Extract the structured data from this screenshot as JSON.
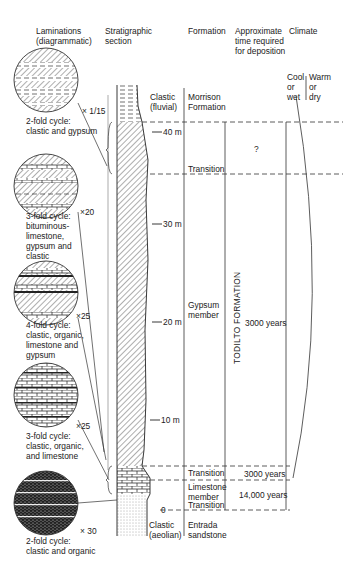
{
  "headers": {
    "laminations": "Laminations\n(diagrammatic)",
    "section": "Stratigraphic\nsection",
    "formation": "Formation",
    "time": "Approximate\ntime required\nfor deposition",
    "climate": "Climate"
  },
  "climate": {
    "cool": "Cool\nor\nwet",
    "warm": "Warm\nor\ndry"
  },
  "laminations": [
    {
      "scale": "× 1/15",
      "caption": "2-fold cycle:\nclastic and gypsum"
    },
    {
      "scale": "×20",
      "caption": "3-fold cycle:\nbituminous-\nlimestone,\ngypsum and\nclastic"
    },
    {
      "scale": "×25",
      "caption": "4-fold cycle:\nclastic, organic,\nlimestone and\ngypsum"
    },
    {
      "scale": "×25",
      "caption": "3-fold cycle:\nclastic, organic,\nand limestone"
    },
    {
      "scale": "× 30",
      "caption": "2-fold cycle:\nclastic and organic"
    }
  ],
  "depth_ticks": [
    "40 m",
    "30 m",
    "20 m",
    "10 m",
    "0"
  ],
  "lithology_labels": {
    "top": "Clastic\n(fluvial)",
    "bottom": "Clastic\n(aeolian)"
  },
  "formations": {
    "morrison": "Morrison\nFormation",
    "transition_upper": "Transition",
    "gypsum": "Gypsum\nmember",
    "transition_mid": "Transition",
    "limestone": "Limestone\nmember",
    "transition_lower": "Transition",
    "entrada": "Entrada\nsandstone",
    "todilto": "TODILTO FORMATION"
  },
  "times": {
    "upper": "?",
    "gypsum": "3000 years",
    "transition": "3000 years",
    "limestone": "14,000 years"
  }
}
